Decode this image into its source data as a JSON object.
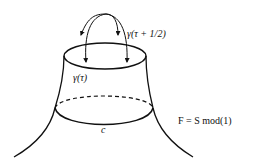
{
  "diagram": {
    "labels": {
      "gamma_shift": "γ(τ + 1/2)",
      "gamma": "γ(τ)",
      "curve_c": "c",
      "formula": "F = S mod(1)"
    },
    "colors": {
      "stroke": "#111111",
      "background": "#ffffff"
    }
  }
}
